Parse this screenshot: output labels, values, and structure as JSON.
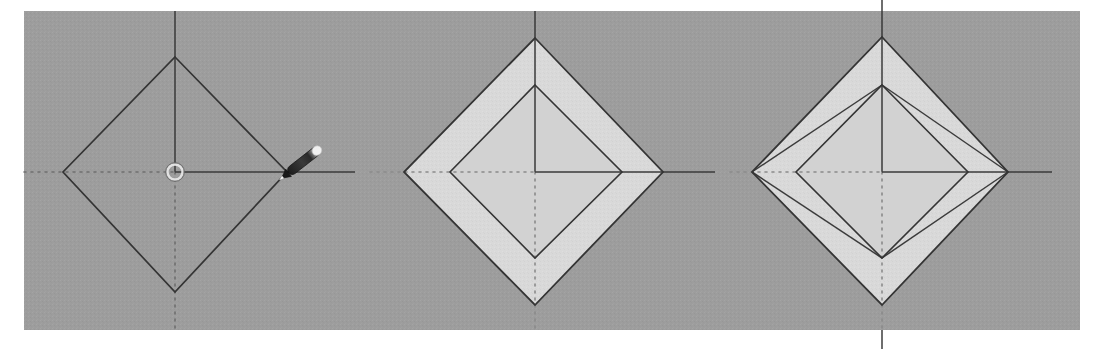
{
  "app": {
    "name": "3D modeling viewport",
    "screenshot_width": 1101,
    "screenshot_height": 349,
    "panel_count": 3,
    "description": "Three sequential viewport frames of a diamond (rotated square) profile being modeled"
  },
  "colors": {
    "page_background": "#ffffff",
    "viewport_background": "#9b9b9b",
    "viewport_background_alt": "#a3a3a3",
    "geometry_stroke": "#343434",
    "face_fill": "#d8d8d8",
    "face_fill_inner": "#d0d0d0",
    "axis_solid": "#3a3a3a",
    "axis_dotted": "#6e6e6e",
    "cursor_body": "#2e2e2e",
    "cursor_tip": "#f2f2f2",
    "inference_point": "#dedede"
  },
  "viewport": {
    "x": 24,
    "y": 11,
    "width": 1056,
    "height": 319
  },
  "panels": [
    {
      "id": "panel-1",
      "label": "Step 1 — base profile drawn",
      "origin": {
        "x": 175,
        "y": 172
      },
      "axes": {
        "vertical": {
          "x": 175,
          "top": 11,
          "bottom": 330,
          "solid_from": 11,
          "solid_to": 172,
          "dotted_from": 172,
          "dotted_to": 330
        },
        "horizontal": {
          "y": 172,
          "left": 24,
          "right": 355,
          "solid_from": 175,
          "solid_to": 355,
          "dotted_from": 24,
          "dotted_to": 175
        }
      },
      "shapes": [
        {
          "name": "outer-diamond",
          "type": "diamond-outline",
          "filled": false,
          "vertices": {
            "top": {
              "x": 175,
              "y": 57
            },
            "right": {
              "x": 287,
              "y": 172
            },
            "bottom": {
              "x": 175,
              "y": 292
            },
            "left": {
              "x": 63,
              "y": 172
            }
          }
        }
      ],
      "markers": [
        {
          "name": "inference-point",
          "type": "circle",
          "x": 175,
          "y": 172,
          "radius": 7
        },
        {
          "name": "pencil-cursor",
          "type": "pencil",
          "tip_x": 287,
          "tip_y": 174,
          "angle_deg": -38
        }
      ]
    },
    {
      "id": "panel-2",
      "label": "Step 2 — offset inner profile creating a face band",
      "origin": {
        "x": 535,
        "y": 172
      },
      "axes": {
        "vertical": {
          "x": 535,
          "top": 11,
          "bottom": 330,
          "solid_from": 11,
          "solid_to": 172,
          "dotted_from": 172,
          "dotted_to": 330
        },
        "horizontal": {
          "y": 172,
          "left": 370,
          "right": 715,
          "solid_from": 535,
          "solid_to": 715,
          "dotted_from": 370,
          "dotted_to": 535
        }
      },
      "shapes": [
        {
          "name": "outer-diamond",
          "type": "diamond-filled",
          "filled": true,
          "vertices": {
            "top": {
              "x": 535,
              "y": 38
            },
            "right": {
              "x": 663,
              "y": 172
            },
            "bottom": {
              "x": 535,
              "y": 305
            },
            "left": {
              "x": 404,
              "y": 172
            }
          }
        },
        {
          "name": "inner-diamond",
          "type": "diamond-filled",
          "filled": true,
          "vertices": {
            "top": {
              "x": 535,
              "y": 85
            },
            "right": {
              "x": 622,
              "y": 172
            },
            "bottom": {
              "x": 535,
              "y": 258
            },
            "left": {
              "x": 450,
              "y": 172
            }
          }
        }
      ],
      "markers": []
    },
    {
      "id": "panel-3",
      "label": "Step 3 — inner profile rotated, lofted edges connect both rings",
      "origin": {
        "x": 882,
        "y": 172
      },
      "axes": {
        "vertical": {
          "x": 882,
          "top": 0,
          "bottom": 349,
          "solid_from": 0,
          "solid_to": 172,
          "dotted_from": 172,
          "dotted_to": 349
        },
        "horizontal": {
          "y": 172,
          "left": 730,
          "right": 1052,
          "solid_from": 882,
          "solid_to": 1052,
          "dotted_from": 730,
          "dotted_to": 882
        }
      },
      "shapes": [
        {
          "name": "outer-diamond",
          "type": "diamond-filled",
          "filled": true,
          "vertices": {
            "top": {
              "x": 882,
              "y": 37
            },
            "right": {
              "x": 1008,
              "y": 172
            },
            "bottom": {
              "x": 882,
              "y": 305
            },
            "left": {
              "x": 752,
              "y": 172
            }
          }
        },
        {
          "name": "inner-diamond",
          "type": "diamond-filled",
          "filled": true,
          "vertices": {
            "top": {
              "x": 882,
              "y": 85
            },
            "right": {
              "x": 968,
              "y": 172
            },
            "bottom": {
              "x": 882,
              "y": 258
            },
            "left": {
              "x": 796,
              "y": 172
            }
          }
        },
        {
          "name": "loft-edges",
          "type": "connector-lines",
          "filled": false,
          "segments": [
            {
              "from": {
                "x": 882,
                "y": 85
              },
              "to": {
                "x": 752,
                "y": 172
              }
            },
            {
              "from": {
                "x": 882,
                "y": 85
              },
              "to": {
                "x": 1008,
                "y": 172
              }
            },
            {
              "from": {
                "x": 882,
                "y": 258
              },
              "to": {
                "x": 752,
                "y": 172
              }
            },
            {
              "from": {
                "x": 882,
                "y": 258
              },
              "to": {
                "x": 1008,
                "y": 172
              }
            }
          ]
        }
      ],
      "markers": []
    }
  ]
}
